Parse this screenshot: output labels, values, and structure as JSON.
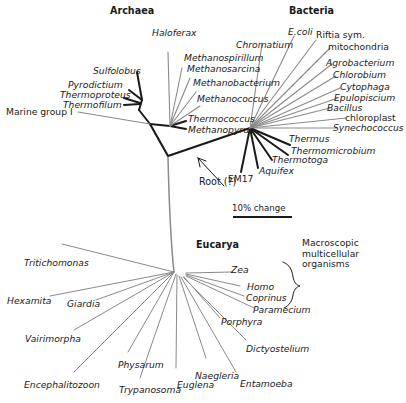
{
  "figure": {
    "type": "unrooted-phylogenetic-tree",
    "title_present": false
  },
  "domains": {
    "archaea": {
      "label": "Archaea"
    },
    "bacteria": {
      "label": "Bacteria"
    },
    "eucarya": {
      "label": "Eucarya"
    }
  },
  "annotations": {
    "root": "Root (?)",
    "macroscopic": "Macroscopic multicellular organisms",
    "scale": "10% change"
  },
  "taxa": {
    "archaea": [
      {
        "name": "Marine group I",
        "italic": false
      },
      {
        "name": "Thermofilum",
        "italic": true
      },
      {
        "name": "Thermoproteus",
        "italic": true
      },
      {
        "name": "Pyrodictium",
        "italic": true
      },
      {
        "name": "Sulfolobus",
        "italic": true
      },
      {
        "name": "Haloferax",
        "italic": true
      },
      {
        "name": "Methanospirillum",
        "italic": true
      },
      {
        "name": "Methanosarcina",
        "italic": true
      },
      {
        "name": "Methanobacterium",
        "italic": true
      },
      {
        "name": "Methanococcus",
        "italic": true
      },
      {
        "name": "Thermococcus",
        "italic": true
      },
      {
        "name": "Methanopyrus",
        "italic": true
      }
    ],
    "bacteria": [
      {
        "name": "Chromatium",
        "italic": true
      },
      {
        "name": "E.coli",
        "italic": true
      },
      {
        "name": "Riftia sym.",
        "italic": false
      },
      {
        "name": "mitochondria",
        "italic": false
      },
      {
        "name": "Agrobacterium",
        "italic": true
      },
      {
        "name": "Chlorobium",
        "italic": true
      },
      {
        "name": "Cytophaga",
        "italic": true
      },
      {
        "name": "Epulopiscium",
        "italic": true
      },
      {
        "name": "Bacillus",
        "italic": true
      },
      {
        "name": "chloroplast",
        "italic": false
      },
      {
        "name": "Synechococcus",
        "italic": true
      },
      {
        "name": "Thermus",
        "italic": true
      },
      {
        "name": "Thermomicrobium",
        "italic": true
      },
      {
        "name": "Thermotoga",
        "italic": true
      },
      {
        "name": "Aquifex",
        "italic": true
      },
      {
        "name": "EM17",
        "italic": false
      }
    ],
    "eucarya": [
      {
        "name": "Tritichomonas",
        "italic": true
      },
      {
        "name": "Hexamita",
        "italic": true
      },
      {
        "name": "Giardia",
        "italic": true
      },
      {
        "name": "Vairimorpha",
        "italic": true
      },
      {
        "name": "Encephalitozoon",
        "italic": true
      },
      {
        "name": "Physarum",
        "italic": true
      },
      {
        "name": "Trypanosoma",
        "italic": true
      },
      {
        "name": "Euglena",
        "italic": true
      },
      {
        "name": "Naegleria",
        "italic": true
      },
      {
        "name": "Entamoeba",
        "italic": true
      },
      {
        "name": "Dictyostelium",
        "italic": true
      },
      {
        "name": "Porphyra",
        "italic": true
      },
      {
        "name": "Paramecium",
        "italic": true
      },
      {
        "name": "Coprinus",
        "italic": true
      },
      {
        "name": "Homo",
        "italic": true
      },
      {
        "name": "Zea",
        "italic": true
      }
    ]
  },
  "macroscopic_group": [
    "Zea",
    "Homo",
    "Coprinus"
  ],
  "colors": {
    "ink": "#1a1a1a",
    "thin_branch": "#8a8a8a",
    "background": "#ffffff"
  }
}
